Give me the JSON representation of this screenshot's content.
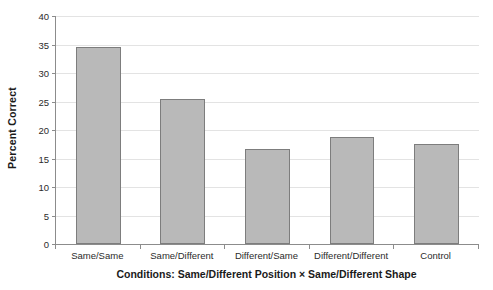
{
  "chart_data": {
    "type": "bar",
    "title": "",
    "categories": [
      "Same/Same",
      "Same/Different",
      "Different/Same",
      "Different/Different",
      "Control"
    ],
    "values": [
      34.5,
      25.4,
      16.6,
      18.7,
      17.6
    ],
    "xlabel": "Conditions:  Same/Different Position × Same/Different Shape",
    "ylabel": "Percent Correct",
    "ylim": [
      0,
      40
    ],
    "ytick_step": 5,
    "yticks": [
      0,
      5,
      10,
      15,
      20,
      25,
      30,
      35,
      40
    ],
    "ytick_labels": [
      "0",
      "5",
      "10",
      "15",
      "20",
      "25",
      "30",
      "35",
      "40"
    ],
    "grid": "horizontal",
    "legend": "none",
    "colors": {
      "bar_fill": "#b9b9b9",
      "bar_edge": "#7d7d7d",
      "gridline": "#e3e3e3",
      "axis": "#8c8c8c",
      "text": "#1a1a1a",
      "background": "#ffffff"
    }
  }
}
